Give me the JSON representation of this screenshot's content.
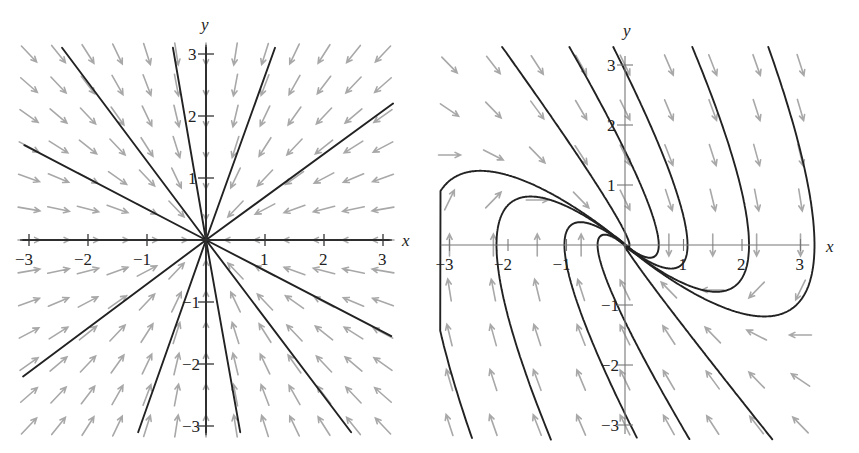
{
  "chart_data": [
    {
      "type": "vector_field",
      "title": "",
      "description": "Phase portrait: star (proper) node, all trajectories are straight lines into the origin",
      "xlabel": "x",
      "ylabel": "y",
      "xlim": [
        -3,
        3
      ],
      "ylim": [
        -3,
        3
      ],
      "x_ticks": [
        -3,
        -2,
        -1,
        1,
        2,
        3
      ],
      "y_ticks": [
        -3,
        -2,
        -1,
        1,
        2,
        3
      ],
      "x_tick_labels": [
        "−3",
        "−2",
        "−1",
        "1",
        "2",
        "3"
      ],
      "y_tick_labels": [
        "−3",
        "−2",
        "−1",
        "1",
        "2",
        "3"
      ],
      "grid": false,
      "system": {
        "dx": [
          -1,
          0
        ],
        "dy": [
          0,
          -1
        ]
      },
      "field_grid": {
        "x": [
          -3,
          3
        ],
        "y": [
          -3,
          3
        ],
        "n": 13
      },
      "trajectories": [
        [
          [
            -2.44,
            3.1
          ],
          [
            0,
            0
          ]
        ],
        [
          [
            -0.56,
            3.1
          ],
          [
            0,
            0
          ]
        ],
        [
          [
            1.17,
            3.1
          ],
          [
            0,
            0
          ]
        ],
        [
          [
            3.17,
            2.2
          ],
          [
            0,
            0
          ]
        ],
        [
          [
            -3.08,
            1.53
          ],
          [
            0,
            0
          ]
        ],
        [
          [
            -3.1,
            -2.2
          ],
          [
            0,
            0
          ]
        ],
        [
          [
            -1.15,
            -3.1
          ],
          [
            0,
            0
          ]
        ],
        [
          [
            0.58,
            -3.1
          ],
          [
            0,
            0
          ]
        ],
        [
          [
            2.46,
            -3.1
          ],
          [
            0,
            0
          ]
        ],
        [
          [
            3.14,
            -1.55
          ],
          [
            0,
            0
          ]
        ],
        [
          [
            0,
            3.1
          ],
          [
            0,
            -3.1
          ]
        ],
        [
          [
            -3.1,
            0
          ],
          [
            3.1,
            0
          ]
        ]
      ]
    },
    {
      "type": "vector_field",
      "title": "",
      "description": "Phase portrait: degenerate (improper) stable node, repeated eigenvalue -1, eigenvector along y = -x",
      "xlabel": "x",
      "ylabel": "y",
      "xlim": [
        -3,
        3
      ],
      "ylim": [
        -3,
        3
      ],
      "x_ticks": [
        -3,
        -2,
        -1,
        1,
        2,
        3
      ],
      "y_ticks": [
        -3,
        -2,
        -1,
        1,
        2,
        3
      ],
      "x_tick_labels": [
        "−3",
        "−2",
        "−1",
        "1",
        "2",
        "3"
      ],
      "y_tick_labels": [
        "−3",
        "−2",
        "−1",
        "1",
        "2",
        "3"
      ],
      "grid": false,
      "system": {
        "dx": [
          0,
          1
        ],
        "dy": [
          -1,
          -2
        ]
      },
      "field_grid": {
        "x": [
          -3,
          3
        ],
        "y": [
          -3,
          3
        ],
        "n": 9
      },
      "trajectory_starts": [
        [
          -2.1,
          3.3
        ],
        [
          -0.95,
          3.3
        ],
        [
          -0.2,
          3.3
        ],
        [
          1.15,
          3.3
        ],
        [
          2.45,
          3.3
        ],
        [
          -2.55,
          -3.4
        ],
        [
          -1.2,
          -3.4
        ],
        [
          0.3,
          -3.4
        ],
        [
          1.2,
          -3.4
        ],
        [
          2.65,
          -3.4
        ]
      ]
    }
  ],
  "labels": {
    "left": {
      "x_axis": "x",
      "y_axis": "y"
    },
    "right": {
      "x_axis": "x",
      "y_axis": "y"
    }
  }
}
